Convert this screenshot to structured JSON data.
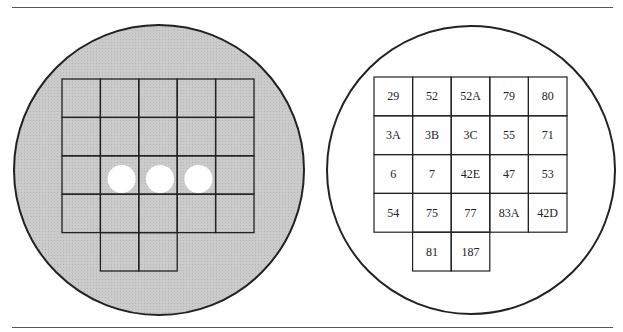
{
  "figure": {
    "left_panel": {
      "description": "shaded dish with grid, three wells punched in row 3",
      "fill_color": "#c8c8c8",
      "grid_rows": 5,
      "grid_cols": 5,
      "wells": [
        {
          "row": 2,
          "col": 1
        },
        {
          "row": 2,
          "col": 2
        },
        {
          "row": 2,
          "col": 3
        }
      ]
    },
    "right_panel": {
      "description": "white dish with labeled grid",
      "rows": [
        [
          "29",
          "52",
          "52A",
          "79",
          "80"
        ],
        [
          "3A",
          "3B",
          "3C",
          "55",
          "71"
        ],
        [
          "6",
          "7",
          "42E",
          "47",
          "53"
        ],
        [
          "54",
          "75",
          "77",
          "83A",
          "42D"
        ],
        [
          "",
          "81",
          "187",
          "",
          ""
        ]
      ]
    }
  }
}
